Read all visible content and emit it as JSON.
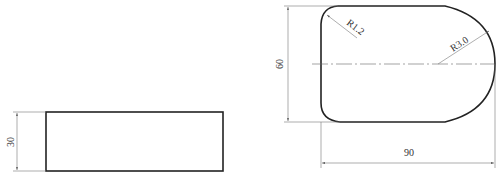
{
  "views": {
    "side_view": {
      "height_dimension": "30"
    },
    "top_view": {
      "height_dimension": "60",
      "width_dimension": "90",
      "corner_radius_label": "R1.2",
      "end_radius_label": "R3.0"
    }
  },
  "colors": {
    "outline": "#222222",
    "dimension": "#777777",
    "background": "#ffffff"
  }
}
